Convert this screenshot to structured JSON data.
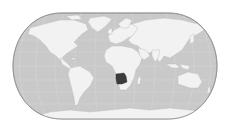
{
  "map": {
    "type": "locator-map",
    "projection": "Eckert-style pseudocylindrical",
    "highlighted_region": "Angola",
    "colors": {
      "background": "#ffffff",
      "ocean": "#c9c9c9",
      "ocean_edge": "#9a9a9a",
      "land": "#f2f2f2",
      "land_border": "#b8b8b8",
      "highlight": "#3c3c3c",
      "graticule": "#dedede"
    },
    "extent": {
      "left": 13,
      "top": 13,
      "right": 217,
      "bottom": 119
    }
  }
}
